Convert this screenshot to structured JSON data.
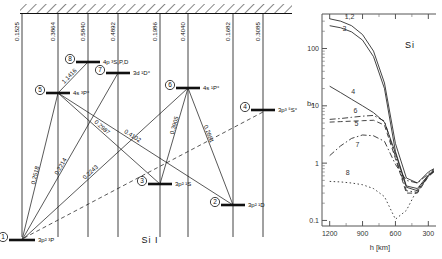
{
  "figure": {
    "caption": "Si I",
    "element_symbol": "Si"
  },
  "grotrian": {
    "name": "grotrian-energy-level-diagram",
    "ionization_limit_label": "",
    "levels": [
      {
        "id": "1",
        "number": "1",
        "term": "3p² ³P",
        "x": 22,
        "y": 240,
        "bar_w": 26,
        "wavelength_to_limit": "0.1525",
        "col_x": 22
      },
      {
        "id": "2",
        "number": "2",
        "term": "3p² ¹D",
        "x": 233,
        "y": 205,
        "bar_w": 24,
        "wavelength_to_limit": "0.1682",
        "col_x": 233
      },
      {
        "id": "3",
        "number": "3",
        "term": "3p² ¹S",
        "x": 160,
        "y": 184,
        "bar_w": 24,
        "wavelength_to_limit": "0.1986",
        "col_x": 160
      },
      {
        "id": "4",
        "number": "4",
        "term": "3p³ ⁵S°",
        "x": 263,
        "y": 110,
        "bar_w": 24,
        "wavelength_to_limit": "0.3085",
        "col_x": 263
      },
      {
        "id": "5",
        "number": "5",
        "term": "4s ³P°",
        "x": 58,
        "y": 93,
        "bar_w": 24,
        "wavelength_to_limit": "0.3864",
        "col_x": 58
      },
      {
        "id": "6",
        "number": "6",
        "term": "4s ¹P°",
        "x": 188,
        "y": 88,
        "bar_w": 24,
        "wavelength_to_limit": "0.4040",
        "col_x": 188
      },
      {
        "id": "7",
        "number": "7",
        "term": "3d ¹D°",
        "x": 118,
        "y": 73,
        "bar_w": 24,
        "wavelength_to_limit": "0.4892",
        "col_x": 118
      },
      {
        "id": "8",
        "number": "8",
        "term": "4p ³S,P,D",
        "x": 88,
        "y": 62,
        "bar_w": 24,
        "wavelength_to_limit": "0.5840",
        "col_x": 88
      }
    ],
    "transitions": [
      {
        "from": "5",
        "to": "8",
        "label": "1.1416"
      },
      {
        "from": "1",
        "to": "5",
        "label": "0.2518"
      },
      {
        "from": "1",
        "to": "7",
        "label": "0.2214"
      },
      {
        "from": "1",
        "to": "6",
        "label": "0.2243"
      },
      {
        "from": "5",
        "to": "3",
        "label": "0.2987"
      },
      {
        "from": "5",
        "to": "2",
        "label": "0.4102"
      },
      {
        "from": "6",
        "to": "3",
        "label": "0.3905"
      },
      {
        "from": "6",
        "to": "2",
        "label": "0.2881"
      }
    ]
  },
  "chart_data": {
    "type": "line",
    "title": "",
    "annotation": "Si",
    "xlabel": "h [km]",
    "ylabel": "bₙ",
    "xticks": [
      "1200",
      "900",
      "600",
      "300"
    ],
    "xtick_values": [
      1200,
      900,
      600,
      300
    ],
    "xlim": [
      1270,
      230
    ],
    "yticks": [
      "0.1",
      "1",
      "10",
      "100"
    ],
    "ytick_values": [
      0.1,
      1,
      10,
      100
    ],
    "ylim": [
      0.08,
      400
    ],
    "yscale": "log",
    "grid": false,
    "legend": "inline-curve-labels",
    "x": [
      1200,
      1100,
      1000,
      900,
      800,
      700,
      600,
      500,
      400,
      300,
      250
    ],
    "series": [
      {
        "name": "1,2",
        "label": "1,2",
        "style": "solid",
        "values": [
          330,
          300,
          250,
          175,
          90,
          25,
          2.2,
          0.55,
          0.45,
          0.7,
          0.8
        ]
      },
      {
        "name": "3",
        "label": "3",
        "style": "solid",
        "values": [
          250,
          230,
          195,
          140,
          72,
          20,
          1.6,
          0.4,
          0.36,
          0.62,
          0.75
        ]
      },
      {
        "name": "4",
        "label": "4",
        "style": "solid",
        "values": [
          22,
          17,
          13,
          10,
          7.6,
          5.2,
          1.5,
          0.38,
          0.33,
          0.6,
          0.72
        ]
      },
      {
        "name": "5",
        "label": "5",
        "style": "dashed",
        "values": [
          5.2,
          5.3,
          5.4,
          5.5,
          5.6,
          4.6,
          1.2,
          0.3,
          0.3,
          0.58,
          0.7
        ]
      },
      {
        "name": "6",
        "label": "6",
        "style": "dash-dot",
        "values": [
          5.8,
          6.0,
          6.3,
          6.6,
          6.8,
          5.4,
          1.3,
          0.33,
          0.31,
          0.6,
          0.72
        ]
      },
      {
        "name": "7",
        "label": "7",
        "style": "dash-dot",
        "values": [
          1.35,
          2.0,
          2.7,
          3.1,
          3.0,
          2.4,
          0.95,
          0.5,
          0.45,
          0.65,
          0.78
        ]
      },
      {
        "name": "8",
        "label": "8",
        "style": "dotted",
        "values": [
          0.48,
          0.47,
          0.45,
          0.42,
          0.36,
          0.26,
          0.105,
          0.15,
          0.35,
          0.62,
          0.7
        ]
      }
    ]
  }
}
